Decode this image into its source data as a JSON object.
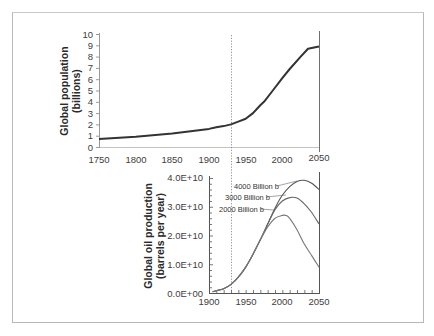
{
  "chart_data": [
    {
      "type": "line",
      "title": "",
      "xlabel": "",
      "ylabel": "Global population (billions)",
      "ylabel_lines": [
        "Global population",
        "(billions)"
      ],
      "xlim": [
        1750,
        2050
      ],
      "ylim": [
        0,
        10
      ],
      "x_ticks": [
        1750,
        1800,
        1850,
        1900,
        1950,
        2000,
        2050
      ],
      "y_ticks": [
        0,
        1,
        2,
        3,
        4,
        5,
        6,
        7,
        8,
        9,
        10
      ],
      "grid": false,
      "series": [
        {
          "name": "Global population",
          "x": [
            1750,
            1800,
            1850,
            1900,
            1910,
            1920,
            1930,
            1940,
            1950,
            1960,
            1970,
            1975,
            1987,
            2000,
            2010,
            2025,
            2035,
            2050
          ],
          "values": [
            0.7,
            0.9,
            1.2,
            1.6,
            1.75,
            1.85,
            2.0,
            2.25,
            2.5,
            3.0,
            3.7,
            4.0,
            5.0,
            6.1,
            6.9,
            8.0,
            8.7,
            8.9
          ]
        }
      ],
      "annotations": [
        {
          "type": "vertical-dotted-line",
          "x": 1930
        }
      ]
    },
    {
      "type": "line",
      "title": "",
      "xlabel": "",
      "ylabel": "Global oil production (barrels per year)",
      "ylabel_lines": [
        "Global oil production",
        "(barrels per year)"
      ],
      "xlim": [
        1900,
        2050
      ],
      "ylim": [
        0,
        40000000000.0
      ],
      "x_ticks": [
        1900,
        1950,
        2000,
        2050
      ],
      "y_ticks": [
        "0.0E+00",
        "1.0E+10",
        "2.0E+10",
        "3.0E+10",
        "4.0E+10"
      ],
      "grid": false,
      "series": [
        {
          "name": "4000 Billion b",
          "x": [
            1905,
            1920,
            1930,
            1940,
            1950,
            1960,
            1970,
            1980,
            1990,
            2000,
            2010,
            2020,
            2030,
            2040,
            2050
          ],
          "values": [
            500000000.0,
            1500000000.0,
            3000000000.0,
            5500000000.0,
            9000000000.0,
            13500000000.0,
            18500000000.0,
            24000000000.0,
            29500000000.0,
            34000000000.0,
            37000000000.0,
            38800000000.0,
            39200000000.0,
            38200000000.0,
            36000000000.0
          ]
        },
        {
          "name": "3000 Billion b",
          "x": [
            1905,
            1920,
            1930,
            1940,
            1950,
            1960,
            1970,
            1980,
            1990,
            2000,
            2010,
            2020,
            2030,
            2040,
            2050
          ],
          "values": [
            500000000.0,
            1500000000.0,
            3000000000.0,
            5500000000.0,
            9000000000.0,
            13500000000.0,
            18500000000.0,
            24000000000.0,
            29000000000.0,
            32000000000.0,
            33200000000.0,
            33000000000.0,
            31000000000.0,
            28000000000.0,
            24000000000.0
          ]
        },
        {
          "name": "2000 Billion b",
          "x": [
            1905,
            1920,
            1930,
            1940,
            1950,
            1960,
            1970,
            1980,
            1990,
            2000,
            2005,
            2010,
            2020,
            2030,
            2040,
            2050
          ],
          "values": [
            500000000.0,
            1500000000.0,
            3000000000.0,
            5500000000.0,
            9000000000.0,
            13500000000.0,
            18500000000.0,
            23000000000.0,
            26000000000.0,
            27000000000.0,
            27000000000.0,
            26000000000.0,
            22000000000.0,
            17000000000.0,
            13000000000.0,
            9000000000.0
          ]
        }
      ],
      "legend": {
        "position": "inline-annotations",
        "entries": [
          "4000 Billion b",
          "3000 Billion b",
          "2000 Billion b"
        ]
      },
      "annotations": [
        {
          "type": "vertical-dotted-line",
          "x": 1930
        }
      ]
    }
  ],
  "top": {
    "ylabel1": "Global population",
    "ylabel2": "(billions)",
    "yticks": [
      "0",
      "1",
      "2",
      "3",
      "4",
      "5",
      "6",
      "7",
      "8",
      "9",
      "10"
    ],
    "xticks": [
      "1750",
      "1800",
      "1850",
      "1900",
      "1950",
      "2000",
      "2050"
    ]
  },
  "bottom": {
    "ylabel1": "Global oil production",
    "ylabel2": "(barrels per year)",
    "yticks": [
      "0.0E+00",
      "1.0E+10",
      "2.0E+10",
      "3.0E+10",
      "4.0E+10"
    ],
    "xticks": [
      "1900",
      "1950",
      "2000",
      "2050"
    ],
    "labels": [
      "4000 Billion b",
      "3000 Billion b",
      "2000 Billion b"
    ]
  }
}
